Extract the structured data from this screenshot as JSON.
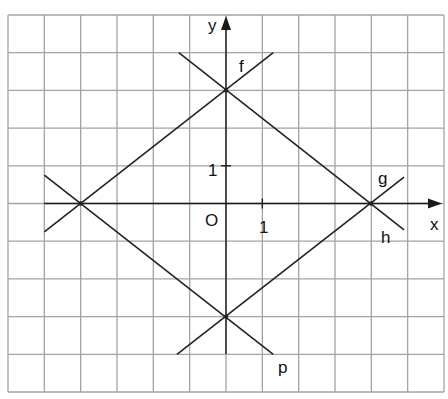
{
  "diagram": {
    "type": "coordinate-grid-with-lines",
    "grid": {
      "x_range": [
        -6,
        6
      ],
      "y_range": [
        -5,
        5
      ],
      "color": "#a3a3a3"
    },
    "axes": {
      "x_label": "x",
      "y_label": "y",
      "origin_label": "O",
      "x_tick_label": "1",
      "y_tick_label": "1"
    },
    "lines": [
      {
        "name": "f",
        "label": "f",
        "from": [
          -5.0,
          -0.75
        ],
        "to": [
          1.3,
          4.0
        ],
        "slope": 0.75,
        "intercept": 3
      },
      {
        "name": "h",
        "label": "h",
        "from": [
          -1.3,
          4.0
        ],
        "to": [
          4.9,
          -0.7
        ],
        "slope": -0.75,
        "intercept": 3
      },
      {
        "name": "p",
        "label": "p",
        "from": [
          -5.0,
          0.75
        ],
        "to": [
          1.3,
          -4.0
        ],
        "slope": -0.75,
        "intercept": -3
      },
      {
        "name": "g",
        "label": "g",
        "from": [
          -1.35,
          -4.0
        ],
        "to": [
          4.9,
          0.7
        ],
        "slope": 0.75,
        "intercept": -3
      }
    ],
    "intersections": [
      {
        "point": [
          0,
          3
        ]
      },
      {
        "point": [
          -4,
          0
        ]
      },
      {
        "point": [
          0,
          -3
        ]
      },
      {
        "point": [
          4,
          0
        ]
      }
    ],
    "line_color": "#222222"
  }
}
